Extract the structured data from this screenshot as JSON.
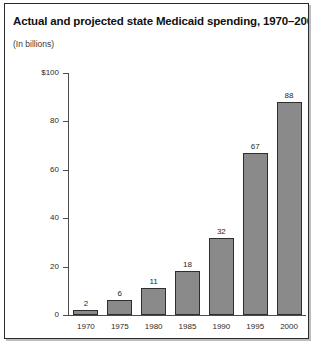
{
  "figure": {
    "title": "Actual and projected state Medicaid spending, 1970–2000",
    "subtitle": "(In billions)"
  },
  "colors": {
    "frame": "#2b2b2b",
    "shadow": "#bdbdbd",
    "bar_fill": "#8a8a8a",
    "bar_stroke": "#2e2e2e",
    "axis": "#4d4d4d",
    "text": "#1f1f1f",
    "background": "#ffffff"
  },
  "chart_data": {
    "type": "bar",
    "title": "Actual and projected state Medicaid spending, 1970–2000",
    "subtitle": "(In billions)",
    "xlabel": "",
    "ylabel": "",
    "categories": [
      "1970",
      "1975",
      "1980",
      "1985",
      "1990",
      "1995",
      "2000"
    ],
    "values": [
      2,
      6,
      11,
      18,
      32,
      67,
      88
    ],
    "value_labels": [
      "2",
      "6",
      "11",
      "18",
      "32",
      "67",
      "88"
    ],
    "ylim": [
      0,
      100
    ],
    "yticks": [
      0,
      20,
      40,
      60,
      80,
      100
    ],
    "ytick_labels": [
      "0",
      "20",
      "40",
      "60",
      "80",
      "$100"
    ],
    "grid": false,
    "legend": false,
    "units": "billions of dollars"
  }
}
